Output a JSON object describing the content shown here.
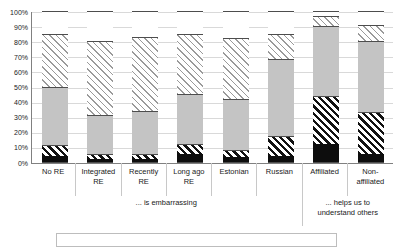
{
  "chart_data": {
    "type": "bar",
    "subtype": "stacked-100-percent",
    "title": "",
    "xlabel": "",
    "ylabel": "",
    "ylim": [
      0,
      100
    ],
    "grid": true,
    "legend_position": "bottom",
    "categories": [
      "No RE",
      "Integrated RE",
      "Recently RE",
      "Long ago RE",
      "Estonian",
      "Russian",
      "Affiliated",
      "Non-affiliated"
    ],
    "category_lines": [
      [
        "No RE"
      ],
      [
        "Integrated",
        "RE"
      ],
      [
        "Recently",
        "RE"
      ],
      [
        "Long ago",
        "RE"
      ],
      [
        "Estonian"
      ],
      [
        "Russian"
      ],
      [
        "Affiliated"
      ],
      [
        "Non-",
        "affiliated"
      ]
    ],
    "groups": [
      {
        "label_lines": [
          "... is embarrassing"
        ],
        "start": 0,
        "end": 5
      },
      {
        "label_lines": [
          "... helps us to",
          "understand others"
        ],
        "start": 6,
        "end": 7
      }
    ],
    "ytick_labels": [
      "100%",
      "90%",
      "80%",
      "70%",
      "60%",
      "50%",
      "40%",
      "30%",
      "20%",
      "10%",
      "0%"
    ],
    "ytick_values": [
      100,
      90,
      80,
      70,
      60,
      50,
      40,
      30,
      20,
      10,
      0
    ],
    "series": [
      {
        "name": "segment-1",
        "fill": "black",
        "values": [
          4,
          2,
          2,
          5,
          3,
          4,
          12,
          5
        ]
      },
      {
        "name": "segment-2",
        "fill": "hatch-bold",
        "values": [
          7,
          3,
          3,
          7,
          5,
          13,
          32,
          28
        ]
      },
      {
        "name": "segment-3",
        "fill": "gray",
        "values": [
          39,
          26,
          29,
          33,
          34,
          51,
          46,
          47
        ]
      },
      {
        "name": "segment-4",
        "fill": "hatch-light",
        "values": [
          35,
          49,
          49,
          40,
          40,
          17,
          7,
          11
        ]
      },
      {
        "name": "segment-5",
        "fill": "white",
        "values": [
          15,
          20,
          17,
          15,
          18,
          15,
          3,
          9
        ]
      }
    ]
  }
}
